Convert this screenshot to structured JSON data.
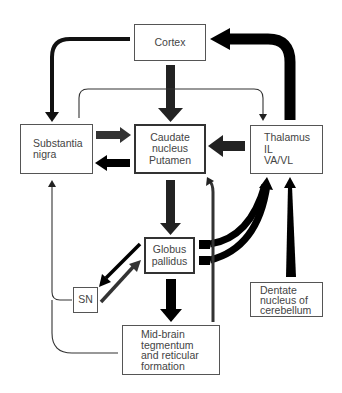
{
  "diagram": {
    "nodes": {
      "cortex": {
        "lines": [
          "Cortex"
        ]
      },
      "substantia_nigra": {
        "lines": [
          "Substantia",
          "nigra"
        ]
      },
      "caudate": {
        "lines": [
          "Caudate",
          "nucleus",
          "Putamen"
        ]
      },
      "thalamus": {
        "lines": [
          "Thalamus",
          "IL",
          "VA/VL"
        ]
      },
      "globus_pallidus": {
        "lines": [
          "Globus",
          "pallidus"
        ]
      },
      "sn": {
        "lines": [
          "SN"
        ]
      },
      "midbrain": {
        "lines": [
          "Mid-brain",
          "tegmentum",
          "and reticular",
          "formation"
        ]
      },
      "dentate": {
        "lines": [
          "Dentate",
          "nucleus of",
          "cerebellum"
        ]
      }
    },
    "edges": [
      {
        "from": "cortex",
        "to": "substantia_nigra",
        "weight": "medium"
      },
      {
        "from": "cortex",
        "to": "caudate",
        "weight": "heavy"
      },
      {
        "from": "thalamus",
        "to": "cortex",
        "weight": "heavy"
      },
      {
        "from": "substantia_nigra",
        "to": "thalamus",
        "weight": "thin"
      },
      {
        "from": "substantia_nigra",
        "to": "caudate",
        "weight": "heavy"
      },
      {
        "from": "caudate",
        "to": "substantia_nigra",
        "weight": "heavy"
      },
      {
        "from": "thalamus",
        "to": "caudate",
        "weight": "heavy"
      },
      {
        "from": "caudate",
        "to": "globus_pallidus",
        "weight": "heavy"
      },
      {
        "from": "globus_pallidus",
        "to": "thalamus",
        "weight": "heavy"
      },
      {
        "from": "globus_pallidus",
        "to": "sn",
        "weight": "medium"
      },
      {
        "from": "sn",
        "to": "globus_pallidus",
        "weight": "medium"
      },
      {
        "from": "globus_pallidus",
        "to": "midbrain",
        "weight": "heavy"
      },
      {
        "from": "midbrain",
        "to": "caudate",
        "weight": "medium"
      },
      {
        "from": "sn",
        "to": "substantia_nigra",
        "weight": "thin"
      },
      {
        "from": "midbrain",
        "to": "substantia_nigra",
        "weight": "thin"
      },
      {
        "from": "dentate",
        "to": "thalamus",
        "weight": "heavy"
      }
    ]
  }
}
